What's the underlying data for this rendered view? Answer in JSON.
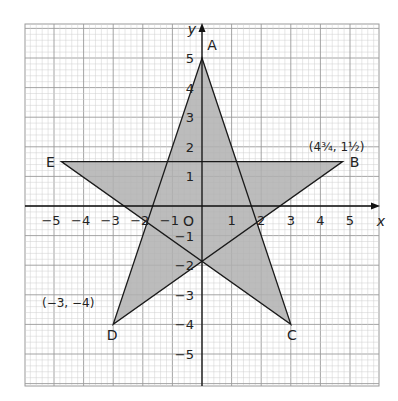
{
  "diagram": {
    "type": "coordinate-grid-star",
    "axes": {
      "x_label": "x",
      "y_label": "y",
      "origin_label": "O",
      "x_ticks": [
        "-5",
        "-4",
        "-3",
        "-2",
        "-1",
        "1",
        "2",
        "3",
        "4",
        "5"
      ],
      "y_ticks": [
        "5",
        "4",
        "3",
        "2",
        "1",
        "-1",
        "-2",
        "-3",
        "-4",
        "-5"
      ],
      "range_x": [
        -6,
        6
      ],
      "range_y": [
        -6,
        6
      ]
    },
    "points": [
      {
        "name": "A",
        "x": 0,
        "y": 5
      },
      {
        "name": "B",
        "x": 4.75,
        "y": 1.5
      },
      {
        "name": "C",
        "x": 3,
        "y": -4
      },
      {
        "name": "D",
        "x": -3,
        "y": -4
      },
      {
        "name": "E",
        "x": -4.75,
        "y": 1.5
      }
    ],
    "annotations": {
      "B_coord": "(4¾, 1½)",
      "D_coord": "(−3, −4)"
    },
    "colors": {
      "fill": "#b0b0b0",
      "stroke": "#1a1a1a",
      "grid_minor": "#cfcfcf",
      "grid_major": "#9a9a9a"
    }
  }
}
